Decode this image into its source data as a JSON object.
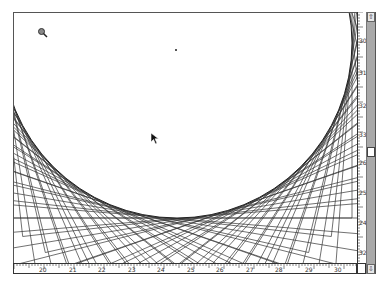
{
  "canvas": {
    "description": "string-art curve drawing",
    "magnifier_cursor": "zoom-tool-icon",
    "pointer_cursor": "arrow-cursor-icon",
    "center_marker": "point-marker"
  },
  "horizontal_ruler": {
    "labels": [
      "20",
      "21",
      "22",
      "23",
      "24",
      "25",
      "26",
      "27",
      "28",
      "29",
      "30"
    ]
  },
  "vertical_ruler": {
    "labels": [
      "30",
      "31",
      "32",
      "33",
      "26",
      "25",
      "24",
      "32"
    ]
  },
  "scrollbar": {
    "up_arrow": "⇧",
    "down_arrow": "⇩"
  },
  "colors": {
    "line": "#333333",
    "scroll_track": "#a9a9a9",
    "background": "#ffffff"
  }
}
